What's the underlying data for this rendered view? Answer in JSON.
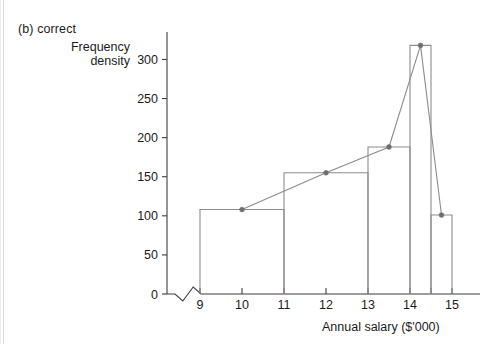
{
  "figure": {
    "caption": "(b) correct",
    "y_axis_label_line1": "Frequency",
    "y_axis_label_line2": "density",
    "x_axis_label": "Annual salary ($'000)"
  },
  "chart_data": {
    "type": "bar",
    "title": "(b) correct",
    "xlabel": "Annual salary ($'000)",
    "ylabel": "Frequency density",
    "grid": false,
    "legend": null,
    "xlim": [
      8.4,
      15.4
    ],
    "ylim": [
      0,
      330
    ],
    "axis_break": true,
    "xticks": [
      9,
      10,
      11,
      12,
      13,
      14,
      14.5,
      15
    ],
    "xtick_labels": [
      "9",
      "10",
      "11",
      "12",
      "13",
      "14",
      "",
      "15"
    ],
    "yticks": [
      0,
      50,
      100,
      150,
      200,
      250,
      300
    ],
    "ytick_labels": [
      "0",
      "50",
      "100",
      "150",
      "200",
      "250",
      "300"
    ],
    "bars": [
      {
        "x_start": 9,
        "x_end": 11,
        "height": 108
      },
      {
        "x_start": 11,
        "x_end": 13,
        "height": 155
      },
      {
        "x_start": 13,
        "x_end": 14,
        "height": 188
      },
      {
        "x_start": 14,
        "x_end": 14.5,
        "height": 318
      },
      {
        "x_start": 14.5,
        "x_end": 15,
        "height": 101
      }
    ],
    "polygon": {
      "name": "frequency polygon",
      "x": [
        10,
        12,
        13.5,
        14.25,
        14.75
      ],
      "values": [
        108,
        155,
        188,
        318,
        101
      ]
    },
    "colors": {
      "bar_outline": "#8c8c8c",
      "polygon_line": "#8c8c8c",
      "marker": "#6e6e6e",
      "axis": "#3d3d3d",
      "text": "#1b1b1b",
      "background": "#ffffff"
    }
  }
}
